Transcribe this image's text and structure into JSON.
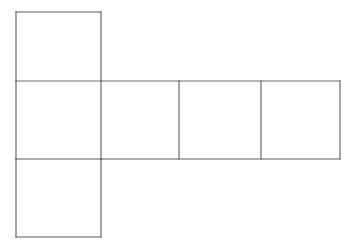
{
  "figure": {
    "name": "cube-net-diagram",
    "kind": "geometric-net",
    "title": "",
    "background_color": "#ffffff",
    "canvas": {
      "width": 356,
      "height": 246
    }
  },
  "style": {
    "line_color": "#5a5a5a",
    "line_color_light": "#6e6e6e",
    "line_width": 1.1,
    "face_fill": "#ffffff"
  },
  "geometry": {
    "description": "Hexomino net of a cube: one square above the left end of a horizontal row of four squares, and one square below that same left end.",
    "column_x": [
      16,
      101,
      179,
      261,
      340
    ],
    "row_y": [
      12,
      81,
      159,
      237
    ],
    "face_count": 6
  },
  "faces": [
    {
      "id": "top-flap",
      "label": "",
      "x": 16,
      "y": 12,
      "width": 85,
      "height": 69
    },
    {
      "id": "row-cell-1",
      "label": "",
      "x": 16,
      "y": 81,
      "width": 85,
      "height": 78
    },
    {
      "id": "row-cell-2",
      "label": "",
      "x": 101,
      "y": 81,
      "width": 78,
      "height": 78
    },
    {
      "id": "row-cell-3",
      "label": "",
      "x": 179,
      "y": 81,
      "width": 82,
      "height": 78
    },
    {
      "id": "row-cell-4",
      "label": "",
      "x": 261,
      "y": 81,
      "width": 79,
      "height": 78
    },
    {
      "id": "bottom-flap",
      "label": "",
      "x": 16,
      "y": 159,
      "width": 85,
      "height": 78
    }
  ],
  "edges": [
    {
      "id": "top-flap-top",
      "x1": 16,
      "y1": 12,
      "x2": 101,
      "y2": 12,
      "tone": "dark"
    },
    {
      "id": "top-flap-left",
      "x1": 16,
      "y1": 12,
      "x2": 16,
      "y2": 81,
      "tone": "dark"
    },
    {
      "id": "top-flap-right",
      "x1": 101,
      "y1": 12,
      "x2": 101,
      "y2": 81,
      "tone": "dark"
    },
    {
      "id": "band-top-left",
      "x1": 16,
      "y1": 81,
      "x2": 101,
      "y2": 81,
      "tone": "light"
    },
    {
      "id": "band-top-right",
      "x1": 101,
      "y1": 81,
      "x2": 340,
      "y2": 81,
      "tone": "light"
    },
    {
      "id": "band-left",
      "x1": 16,
      "y1": 81,
      "x2": 16,
      "y2": 159,
      "tone": "dark"
    },
    {
      "id": "band-divider-1",
      "x1": 101,
      "y1": 81,
      "x2": 101,
      "y2": 159,
      "tone": "dark"
    },
    {
      "id": "band-divider-2",
      "x1": 179,
      "y1": 81,
      "x2": 179,
      "y2": 159,
      "tone": "dark"
    },
    {
      "id": "band-divider-3",
      "x1": 261,
      "y1": 81,
      "x2": 261,
      "y2": 159,
      "tone": "dark"
    },
    {
      "id": "band-right",
      "x1": 340,
      "y1": 81,
      "x2": 340,
      "y2": 159,
      "tone": "dark"
    },
    {
      "id": "band-bottom-left",
      "x1": 16,
      "y1": 159,
      "x2": 101,
      "y2": 159,
      "tone": "dark"
    },
    {
      "id": "band-bottom-right",
      "x1": 101,
      "y1": 159,
      "x2": 340,
      "y2": 159,
      "tone": "dark"
    },
    {
      "id": "bottom-flap-left",
      "x1": 16,
      "y1": 159,
      "x2": 16,
      "y2": 237,
      "tone": "dark"
    },
    {
      "id": "bottom-flap-right",
      "x1": 101,
      "y1": 159,
      "x2": 101,
      "y2": 237,
      "tone": "dark"
    },
    {
      "id": "bottom-flap-bottom",
      "x1": 16,
      "y1": 237,
      "x2": 101,
      "y2": 237,
      "tone": "dark"
    }
  ]
}
